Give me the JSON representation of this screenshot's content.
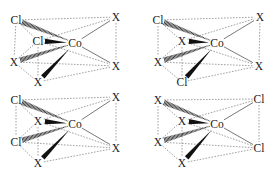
{
  "diagram": {
    "colors": {
      "text": "#222222",
      "dashed_edge": "#8a8a8a",
      "solid_bond": "#555555",
      "wedge": "#111111"
    },
    "panels": [
      {
        "id": "panel-1",
        "offset": [
          0,
          0
        ],
        "center": {
          "label": "Co",
          "pos": [
            75,
            43
          ]
        },
        "ligands": [
          {
            "key": "tl",
            "label": "Cl",
            "pos": [
              16,
              20
            ],
            "bond": "hashed"
          },
          {
            "key": "back",
            "label": "Cl",
            "pos": [
              38,
              41
            ],
            "bond": "wedge-short"
          },
          {
            "key": "l",
            "label": "X",
            "pos": [
              14,
              62
            ],
            "bond": "hashed"
          },
          {
            "key": "b",
            "label": "X",
            "pos": [
              38,
              82
            ],
            "bond": "wedge"
          },
          {
            "key": "tr",
            "label": "X",
            "pos": [
              116,
              17
            ],
            "bond": "line"
          },
          {
            "key": "br",
            "label": "X",
            "pos": [
              116,
              66
            ],
            "bond": "line"
          }
        ]
      },
      {
        "id": "panel-2",
        "offset": [
          142,
          0
        ],
        "center": {
          "label": "Co",
          "pos": [
            75,
            43
          ]
        },
        "ligands": [
          {
            "key": "tl",
            "label": "Cl",
            "pos": [
              16,
              20
            ],
            "bond": "hashed"
          },
          {
            "key": "back",
            "label": "X",
            "pos": [
              40,
              41
            ],
            "bond": "wedge-short"
          },
          {
            "key": "l",
            "label": "X",
            "pos": [
              16,
              62
            ],
            "bond": "hashed"
          },
          {
            "key": "b",
            "label": "Cl",
            "pos": [
              40,
              82
            ],
            "bond": "wedge"
          },
          {
            "key": "tr",
            "label": "X",
            "pos": [
              118,
              17
            ],
            "bond": "line"
          },
          {
            "key": "br",
            "label": "X",
            "pos": [
              117,
              66
            ],
            "bond": "line"
          }
        ]
      },
      {
        "id": "panel-3",
        "offset": [
          0,
          81
        ],
        "center": {
          "label": "Co",
          "pos": [
            75,
            43
          ]
        },
        "ligands": [
          {
            "key": "tl",
            "label": "Cl",
            "pos": [
              16,
              19
            ],
            "bond": "hashed"
          },
          {
            "key": "back",
            "label": "X",
            "pos": [
              38,
              40
            ],
            "bond": "wedge-short"
          },
          {
            "key": "l",
            "label": "Cl",
            "pos": [
              16,
              61
            ],
            "bond": "hashed"
          },
          {
            "key": "b",
            "label": "X",
            "pos": [
              38,
              82
            ],
            "bond": "wedge"
          },
          {
            "key": "tr",
            "label": "X",
            "pos": [
              116,
              16
            ],
            "bond": "line"
          },
          {
            "key": "br",
            "label": "X",
            "pos": [
              116,
              67
            ],
            "bond": "line"
          }
        ]
      },
      {
        "id": "panel-4",
        "offset": [
          142,
          81
        ],
        "center": {
          "label": "Co",
          "pos": [
            75,
            43
          ]
        },
        "ligands": [
          {
            "key": "tl",
            "label": "X",
            "pos": [
              16,
              19
            ],
            "bond": "hashed"
          },
          {
            "key": "back",
            "label": "X",
            "pos": [
              40,
              40
            ],
            "bond": "wedge-short"
          },
          {
            "key": "l",
            "label": "X",
            "pos": [
              16,
              61
            ],
            "bond": "hashed"
          },
          {
            "key": "b",
            "label": "X",
            "pos": [
              40,
              82
            ],
            "bond": "wedge"
          },
          {
            "key": "tr",
            "label": "Cl",
            "pos": [
              117,
              18
            ],
            "bond": "line"
          },
          {
            "key": "br",
            "label": "Cl",
            "pos": [
              117,
              67
            ],
            "bond": "line"
          }
        ]
      }
    ]
  }
}
